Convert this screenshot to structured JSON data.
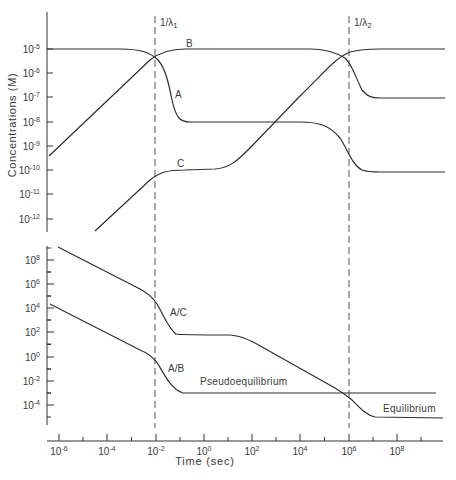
{
  "chart_data": [
    {
      "panel": "top",
      "type": "line",
      "ylabel": "Concentrations (M)",
      "xlabel": "Time (sec)",
      "xscale": "log",
      "yscale": "log",
      "xlim": [
        1e-06,
        10000000000.0
      ],
      "ylim": [
        1e-12,
        0.0001
      ],
      "yticks": [
        "10^-5",
        "10^-6",
        "10^-7",
        "10^-8",
        "10^-9",
        "10^-10",
        "10^-11",
        "10^-12"
      ],
      "vlines": [
        {
          "label": "1/λ1",
          "x": 0.01
        },
        {
          "label": "1/λ2",
          "x": 1000000.0
        }
      ],
      "series": [
        {
          "name": "A",
          "points": [
            [
              1e-06,
              1e-05
            ],
            [
              0.001,
              1e-05
            ],
            [
              0.01,
              5e-06
            ],
            [
              0.03,
              1e-07
            ],
            [
              0.1,
              1e-08
            ],
            [
              100000.0,
              1e-08
            ],
            [
              1000000.0,
              5e-09
            ],
            [
              10000000.0,
              1e-10
            ],
            [
              10000000000.0,
              1e-10
            ]
          ]
        },
        {
          "name": "B",
          "points": [
            [
              1e-06,
              4e-10
            ],
            [
              0.01,
              5e-06
            ],
            [
              0.1,
              1e-05
            ],
            [
              100000.0,
              1e-05
            ],
            [
              1000000.0,
              5e-06
            ],
            [
              10000000.0,
              1e-07
            ],
            [
              10000000000.0,
              1e-07
            ]
          ]
        },
        {
          "name": "C",
          "points": [
            [
              1e-05,
              2e-13
            ],
            [
              0.01,
              6e-11
            ],
            [
              0.1,
              1e-10
            ],
            [
              10,
              1.2e-10
            ],
            [
              1000.0,
              1e-08
            ],
            [
              1000000.0,
              5e-06
            ],
            [
              10000000.0,
              1e-05
            ],
            [
              10000000000.0,
              1e-05
            ]
          ]
        }
      ],
      "annotations": [
        "A",
        "B",
        "C",
        "1/λ1",
        "1/λ2"
      ]
    },
    {
      "panel": "bottom",
      "type": "line",
      "xlabel": "Time (sec)",
      "xscale": "log",
      "yscale": "log",
      "xticks": [
        "10^-6",
        "10^-4",
        "10^-2",
        "10^0",
        "10^2",
        "10^4",
        "10^6",
        "10^8"
      ],
      "yticks": [
        "10^8",
        "10^6",
        "10^4",
        "10^2",
        "10^0",
        "10^-2",
        "10^-4"
      ],
      "series": [
        {
          "name": "A/C",
          "points": [
            [
              1e-06,
              3000000000.0
            ],
            [
              0.001,
              600000.0
            ],
            [
              0.01,
              80000.0
            ],
            [
              0.1,
              100.0
            ],
            [
              10,
              100.0
            ],
            [
              100000.0,
              0.03
            ],
            [
              1000000.0,
              0.001
            ],
            [
              10000000.0,
              1e-05
            ],
            [
              10000000000.0,
              1e-05
            ]
          ]
        },
        {
          "name": "A/B",
          "points": [
            [
              1e-06,
              20000.0
            ],
            [
              0.001,
              5.0
            ],
            [
              0.01,
              0.5
            ],
            [
              0.1,
              0.001
            ],
            [
              10000000000.0,
              0.001
            ]
          ]
        }
      ],
      "annotations": [
        "A/C",
        "A/B",
        "Pseudoequilibrium",
        "Equilibrium"
      ]
    }
  ],
  "labels": {
    "ylabel_top": "Concentrations (M)",
    "xlabel": "Time (sec)",
    "vline1": "1/λ",
    "vline1_sub": "1",
    "vline2": "1/λ",
    "vline2_sub": "2",
    "curve_a": "A",
    "curve_b": "B",
    "curve_c": "C",
    "ratio_ac": "A/C",
    "ratio_ab": "A/B",
    "pseudo": "Pseudoequilibrium",
    "equil": "Equilibrium"
  },
  "ticks": {
    "top_y": [
      {
        "base": "10",
        "exp": "-5",
        "y": 49
      },
      {
        "base": "10",
        "exp": "-6",
        "y": 73
      },
      {
        "base": "10",
        "exp": "-7",
        "y": 97
      },
      {
        "base": "10",
        "exp": "-8",
        "y": 122
      },
      {
        "base": "10",
        "exp": "-9",
        "y": 146
      },
      {
        "base": "10",
        "exp": "-10",
        "y": 170
      },
      {
        "base": "10",
        "exp": "-11",
        "y": 194
      },
      {
        "base": "10",
        "exp": "-12",
        "y": 219
      }
    ],
    "bottom_y": [
      {
        "base": "10",
        "exp": "8",
        "y": 260
      },
      {
        "base": "10",
        "exp": "6",
        "y": 284
      },
      {
        "base": "10",
        "exp": "4",
        "y": 308
      },
      {
        "base": "10",
        "exp": "2",
        "y": 332
      },
      {
        "base": "10",
        "exp": "0",
        "y": 357
      },
      {
        "base": "10",
        "exp": "-2",
        "y": 381
      },
      {
        "base": "10",
        "exp": "-4",
        "y": 405
      }
    ],
    "x": [
      {
        "base": "10",
        "exp": "-6",
        "x": 59
      },
      {
        "base": "10",
        "exp": "-4",
        "x": 107
      },
      {
        "base": "10",
        "exp": "-2",
        "x": 156
      },
      {
        "base": "10",
        "exp": "0",
        "x": 204
      },
      {
        "base": "10",
        "exp": "2",
        "x": 252
      },
      {
        "base": "10",
        "exp": "4",
        "x": 300
      },
      {
        "base": "10",
        "exp": "6",
        "x": 349
      },
      {
        "base": "10",
        "exp": "8",
        "x": 397
      }
    ]
  }
}
